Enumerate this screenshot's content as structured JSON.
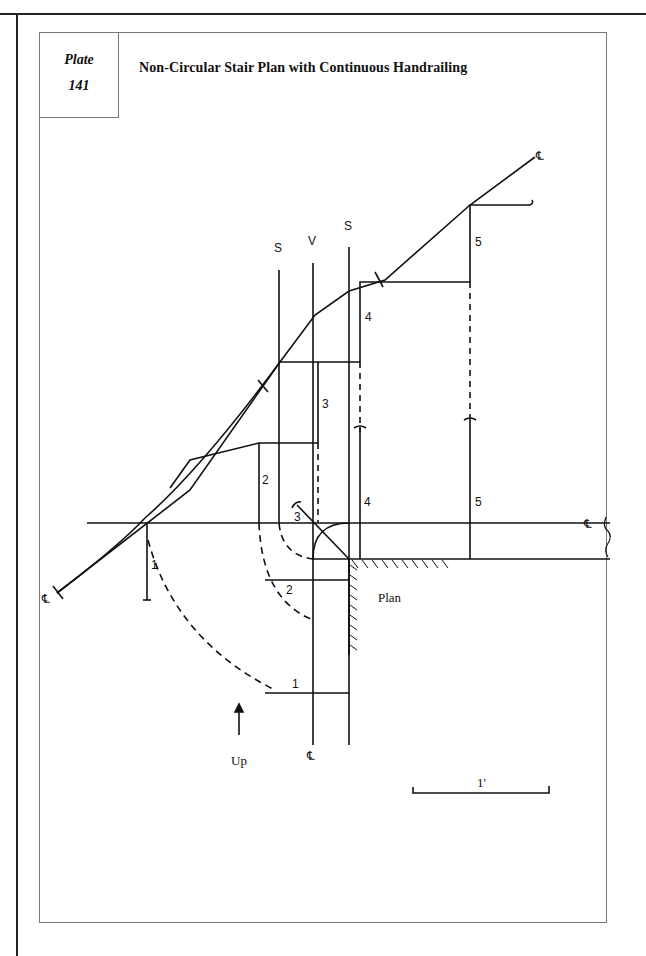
{
  "plate": {
    "word": "Plate",
    "number": "141"
  },
  "title": "Non-Circular Stair Plan with Continuous Handrailing",
  "drawing": {
    "axis_labels": {
      "springing_left": "S",
      "vertical": "V",
      "springing_right": "S"
    },
    "step_labels": {
      "upper": [
        "2",
        "3",
        "4",
        "5"
      ],
      "plan": [
        "1",
        "2",
        "3",
        "4",
        "5"
      ]
    },
    "plan_label": "Plan",
    "direction_label": "Up",
    "scale_label": "1'",
    "centerline_symbol": "℄"
  }
}
